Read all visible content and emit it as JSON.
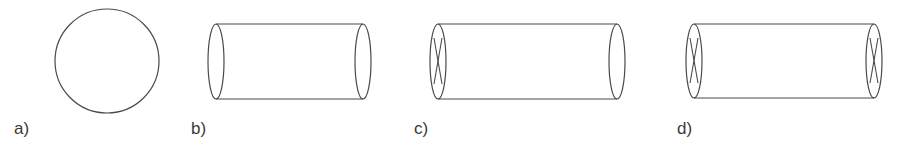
{
  "figure": {
    "panels": [
      {
        "id": "a",
        "label": "a)",
        "shape": "circle",
        "description": "circle",
        "x_marks": []
      },
      {
        "id": "b",
        "label": "b)",
        "shape": "cylinder",
        "description": "open cylinder, no end markings",
        "x_marks": []
      },
      {
        "id": "c",
        "label": "c)",
        "shape": "cylinder",
        "description": "cylinder with cross on left end",
        "x_marks": [
          "left"
        ]
      },
      {
        "id": "d",
        "label": "d)",
        "shape": "cylinder",
        "description": "cylinder with crosses on both ends",
        "x_marks": [
          "left",
          "right"
        ]
      }
    ],
    "colors": {
      "stroke": "#4a4a4a",
      "text": "#3a3a3a",
      "background": "#ffffff"
    }
  }
}
